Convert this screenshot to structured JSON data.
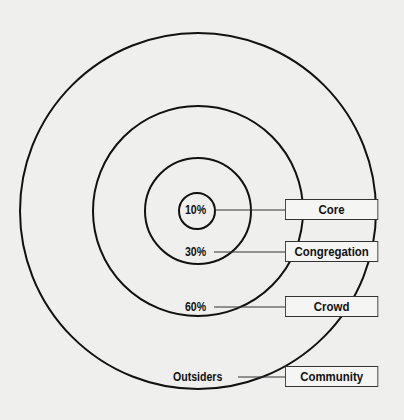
{
  "diagram": {
    "type": "concentric-circles",
    "rings": [
      {
        "id": "core",
        "percent_label": "10%",
        "name": "Core",
        "radius": 18
      },
      {
        "id": "congregation",
        "percent_label": "30%",
        "name": "Congregation",
        "radius": 53
      },
      {
        "id": "crowd",
        "percent_label": "60%",
        "name": "Crowd",
        "radius": 105
      },
      {
        "id": "community",
        "percent_label": "Outsiders",
        "name": "Community",
        "radius": 178
      }
    ],
    "colors": {
      "stroke": "#111111",
      "background": "#efefee"
    }
  }
}
